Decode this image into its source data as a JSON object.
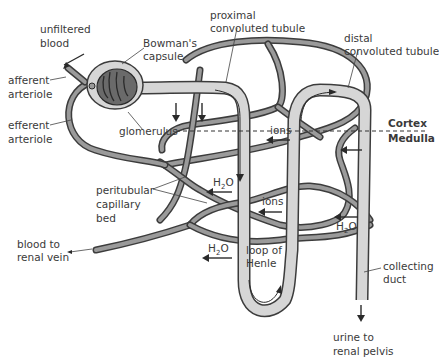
{
  "diagram": {
    "colors": {
      "tubule_fill": "#d6d6d6",
      "vessel_fill": "#9a9a9a",
      "outline": "#3c3c3c",
      "glomerulus": "#6a6a6a",
      "text": "#3a3a3a"
    },
    "labels": {
      "unfiltered_blood_1": "unfiltered",
      "unfiltered_blood_2": "blood",
      "bowmans_1": "Bowman's",
      "bowmans_2": "capsule",
      "afferent_1": "afferent",
      "afferent_2": "arteriole",
      "efferent_1": "efferent",
      "efferent_2": "arteriole",
      "glomerulus": "glomerulus",
      "proximal_1": "proximal",
      "proximal_2": "convoluted tubule",
      "distal_1": "distal",
      "distal_2": "convoluted tubule",
      "cortex": "Cortex",
      "medulla": "Medulla",
      "ions_1": "ions",
      "ions_2": "ions",
      "peritubular_1": "peritubular",
      "peritubular_2": "capillary",
      "peritubular_3": "bed",
      "h2o_1_main": "H",
      "h2o_1_sub": "2",
      "h2o_1_end": "O",
      "h2o_2_main": "H",
      "h2o_2_sub": "2",
      "h2o_2_end": "O",
      "h2o_3_main": "H",
      "h2o_3_sub": "2",
      "h2o_3_end": "O",
      "blood_renal_1": "blood to",
      "blood_renal_2": "renal vein",
      "loop_1": "loop of",
      "loop_2": "Henle",
      "collecting_1": "collecting",
      "collecting_2": "duct",
      "urine_1": "urine to",
      "urine_2": "renal pelvis"
    }
  }
}
